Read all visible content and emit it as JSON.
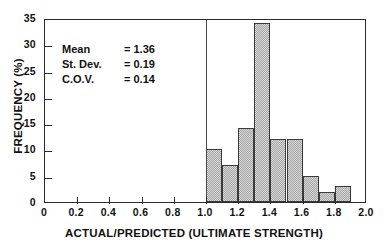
{
  "chart_data": {
    "type": "bar",
    "title": "",
    "xlabel": "ACTUAL/PREDICTED (ULTIMATE STRENGTH)",
    "ylabel": "FREQUENCY (%)",
    "xlim": [
      0,
      2.0
    ],
    "ylim": [
      0,
      35
    ],
    "xticks": [
      "0",
      "0.2",
      "0.4",
      "0.6",
      "0.8",
      "1.0",
      "1.2",
      "1.4",
      "1.6",
      "1.8",
      "2.0"
    ],
    "xtick_values": [
      0,
      0.2,
      0.4,
      0.6,
      0.8,
      1.0,
      1.2,
      1.4,
      1.6,
      1.8,
      2.0
    ],
    "yticks": [
      "0",
      "5",
      "10",
      "15",
      "20",
      "25",
      "30",
      "35"
    ],
    "ytick_values": [
      0,
      5,
      10,
      15,
      20,
      25,
      30,
      35
    ],
    "grid": false,
    "legend": false,
    "bin_width": 0.1,
    "bin_edges": [
      1.0,
      1.1,
      1.2,
      1.3,
      1.4,
      1.5,
      1.6,
      1.7,
      1.8,
      1.9
    ],
    "categories": [
      "1.0-1.1",
      "1.1-1.2",
      "1.2-1.3",
      "1.3-1.4",
      "1.4-1.5",
      "1.5-1.6",
      "1.6-1.7",
      "1.7-1.8",
      "1.8-1.9"
    ],
    "values": [
      10,
      7,
      14,
      34,
      12,
      12,
      5,
      2,
      3
    ],
    "bar_color": "#a6a6a6",
    "bar_edge_color": "#3a3a3a",
    "annotation_line_x": 1.0,
    "annotations": [
      {
        "name": "Mean",
        "value": "= 1.36"
      },
      {
        "name": "St. Dev.",
        "value": "= 0.19"
      },
      {
        "name": "C.O.V.",
        "value": "= 0.14"
      }
    ]
  }
}
